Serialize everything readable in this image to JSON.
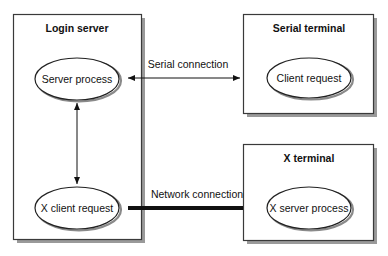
{
  "diagram": {
    "nodes": {
      "login_server": {
        "title": "Login server",
        "process_top": "Server process",
        "process_bottom": "X client request"
      },
      "serial_terminal": {
        "title": "Serial terminal",
        "process": "Client request"
      },
      "x_terminal": {
        "title": "X terminal",
        "process": "X server process"
      }
    },
    "edges": {
      "serial": {
        "label": "Serial connection",
        "from": "Server process",
        "to": "Client request",
        "style": "thin double-headed arrow"
      },
      "network": {
        "label": "Network connection",
        "from": "X client request",
        "to": "X server process",
        "style": "thick line"
      },
      "internal": {
        "from": "Server process",
        "to": "X client request",
        "style": "thin double-headed arrow"
      }
    },
    "colors": {
      "line": "#111111",
      "shadow": "#9a9a9a",
      "background": "#ffffff"
    }
  }
}
